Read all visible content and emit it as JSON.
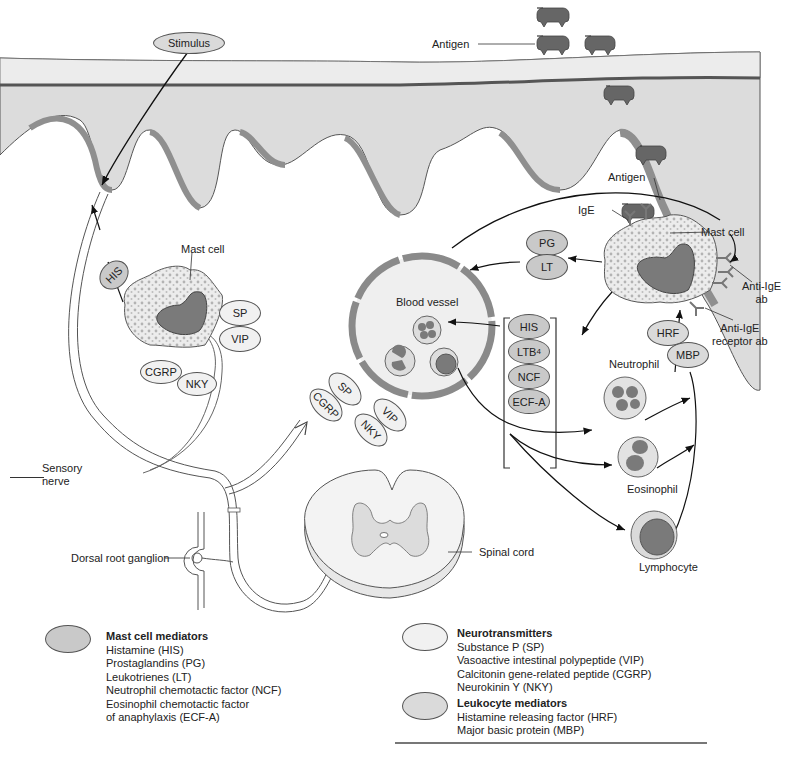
{
  "diagram": {
    "labels": {
      "stimulus": "Stimulus",
      "antigen_top": "Antigen",
      "antigen_mast": "Antigen",
      "ige": "IgE",
      "mast_cell_right": "Mast cell",
      "mast_cell_left": "Mast cell",
      "anti_ige_ab": "Anti-IgE\nab",
      "anti_ige_receptor_ab": "Anti-IgE\nreceptor ab",
      "blood_vessel": "Blood vessel",
      "neutrophil": "Neutrophil",
      "eosinophil": "Eosinophil",
      "lymphocyte": "Lymphocyte",
      "sensory_nerve": "Sensory\nnerve",
      "dorsal_root_ganglion": "Dorsal root ganglion",
      "spinal_cord": "Spinal cord"
    },
    "mediator_ovals": {
      "his_left": "HIS",
      "sp_left": "SP",
      "vip_left": "VIP",
      "cgrp_left": "CGRP",
      "nky_left": "NKY",
      "sp_mid": "SP",
      "cgrp_mid": "CGRP",
      "vip_mid": "VIP",
      "nky_mid": "NKY",
      "pg": "PG",
      "lt": "LT",
      "his_bracket": "HIS",
      "ltb4": "LTB",
      "ltb4_sub": "4",
      "ncf": "NCF",
      "ecfa": "ECF-A",
      "hrf": "HRF",
      "mbp": "MBP"
    }
  },
  "legend": [
    {
      "title": "Mast cell mediators",
      "color": "#c9c9c9",
      "items": [
        "Histamine (HIS)",
        "Prostaglandins (PG)",
        "Leukotrienes (LT)",
        "Neutrophil chemotactic factor (NCF)",
        "Eosinophil chemotactic factor",
        "of anaphylaxis (ECF-A)"
      ]
    },
    {
      "title": "Neurotransmitters",
      "color": "#f1f1f1",
      "items": [
        "Substance P (SP)",
        "Vasoactive intestinal polypeptide (VIP)",
        "Calcitonin gene-related peptide (CGRP)",
        "Neurokinin Y (NKY)"
      ]
    },
    {
      "title": "Leukocyte mediators",
      "color": "#dadada",
      "items": [
        "Histamine releasing factor (HRF)",
        "Major basic protein (MBP)"
      ]
    }
  ],
  "colors": {
    "tissue": "#dcdcdc",
    "surface": "#e9e9e9",
    "dark_layer": "#8f8f8f",
    "antigen": "#666666",
    "nucleus": "#7a7a7a",
    "mast_cyto": "#ececec"
  }
}
